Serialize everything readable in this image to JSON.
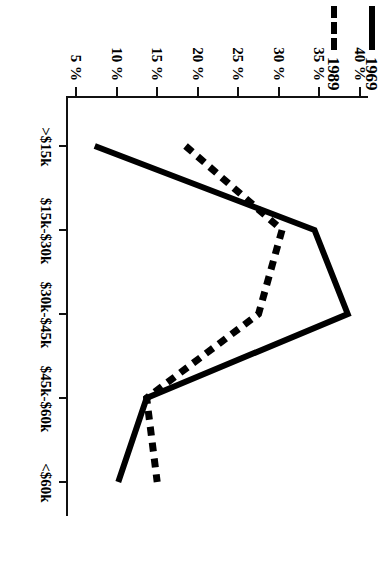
{
  "figure": {
    "background_color": "#ffffff",
    "ink_color": "#000000",
    "orientation": "rotated-90-clockwise-on-page"
  },
  "legend": {
    "position": "top-left",
    "entries": [
      {
        "label": "1969",
        "style": "solid",
        "color": "#000000"
      },
      {
        "label": "1989",
        "style": "dashed",
        "color": "#000000"
      }
    ]
  },
  "axes": {
    "y_ticks": [
      "40 %",
      "35 %",
      "30 %",
      "25 %",
      "20 %",
      "15 %",
      "10 %",
      "5 %"
    ],
    "y_tick_values": [
      40,
      35,
      30,
      25,
      20,
      15,
      10,
      5
    ],
    "x_ticks": [
      ">$15k",
      "$15k-$30k",
      "$30k-$45k",
      "$45k-$60k",
      "<$60k"
    ]
  },
  "chart_data": {
    "type": "line",
    "title": "",
    "subtitle": "",
    "xlabel": "",
    "ylabel": "",
    "categories": [
      ">$15k",
      "$15k-$30k",
      "$30k-$45k",
      "$45k-$60k",
      "<$60k"
    ],
    "series": [
      {
        "name": "1969",
        "style": "solid",
        "color": "#000000",
        "values": [
          7.3,
          34.4,
          38.5,
          13.7,
          10.2
        ]
      },
      {
        "name": "1989",
        "style": "dashed",
        "color": "#000000",
        "values": [
          18.5,
          30.4,
          27.5,
          13.7,
          15.0
        ]
      }
    ],
    "ylim": [
      4,
      41
    ],
    "ytick_labels": [
      "40 %",
      "35 %",
      "30 %",
      "25 %",
      "20 %",
      "15 %",
      "10 %",
      "5 %"
    ],
    "ytick_values": [
      40,
      35,
      30,
      25,
      20,
      15,
      10,
      5
    ],
    "grid": false,
    "legend_position": "top-left",
    "annotations": []
  }
}
